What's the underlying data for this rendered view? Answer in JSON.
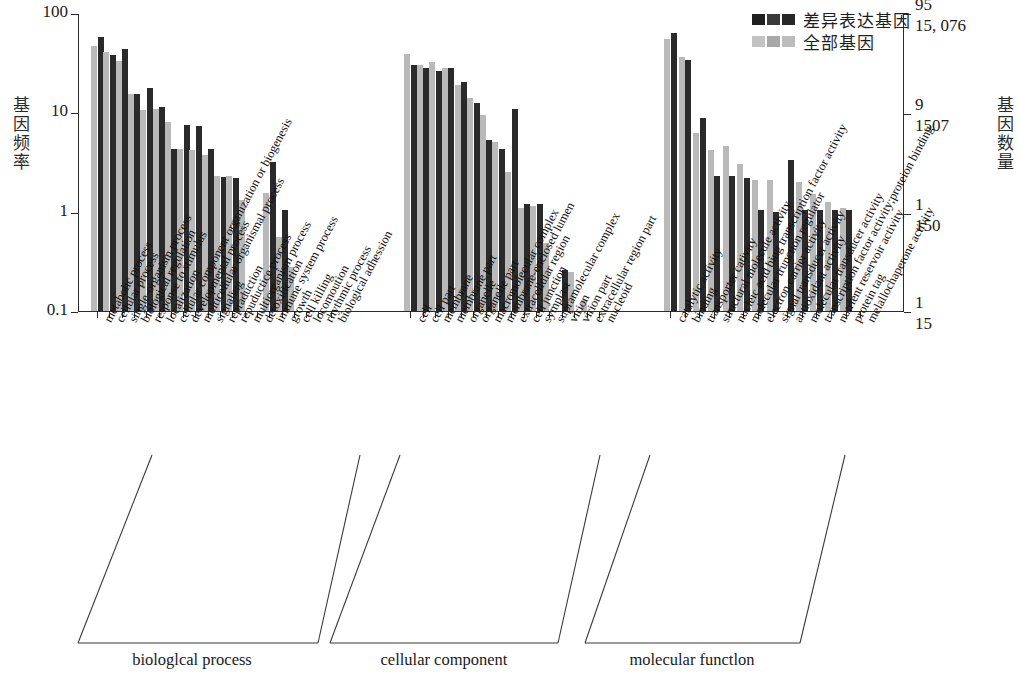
{
  "legend": {
    "items": [
      {
        "label": "差异表达基因",
        "color": "#2a2a2a",
        "key": "deg"
      },
      {
        "label": "全部基因",
        "color": "#b9b9b9",
        "key": "all"
      }
    ]
  },
  "axes": {
    "left": {
      "title": "基因频率",
      "ticks": [
        "100",
        "10",
        "1",
        "0.1"
      ],
      "range": [
        0.1,
        100
      ],
      "scale": "log"
    },
    "right": {
      "title": "基因数量",
      "tick_groups": [
        {
          "upper": "95",
          "lower": "15, 076"
        },
        {
          "upper": "9",
          "lower": "1507"
        },
        {
          "upper": "1",
          "lower": "150"
        },
        {
          "upper": "1",
          "lower": "15"
        }
      ]
    }
  },
  "groups": [
    {
      "name": "biologlcal process",
      "start": 0,
      "end": 17
    },
    {
      "name": "cellular component",
      "start": 17,
      "end": 33
    },
    {
      "name": "molecular functlon",
      "start": 33,
      "end": 48
    }
  ],
  "chart_data": {
    "type": "bar",
    "title": "",
    "xlabel": "",
    "ylabel": "基因频率",
    "ylabel_right": "基因数量",
    "ylim": [
      0.1,
      100
    ],
    "yscale": "log",
    "grid": false,
    "legend_position": "top-right",
    "categories": [
      "metabolic process",
      "cellular process",
      "single-organism process",
      "biological regulation",
      "response to stimulus",
      "localization",
      "cellular component organization or biogenesis",
      "developmental process",
      "multicellular organismal process",
      "signaling",
      "repraduction",
      "repuductice process",
      "multiorganism process",
      "detoxification",
      "immune system process",
      "growth",
      "cell killing",
      "locomoution",
      "rhythmic process",
      "biological adhession",
      "cell",
      "cell part",
      "membrane",
      "membrane part",
      "organelle",
      "organelle part",
      "macromolecular complex",
      "membrane-enclosed lumen",
      "extracellular region",
      "cell junction",
      "symplast",
      "supramolecular complex",
      "virion",
      "virion part",
      "extracellular region part",
      "nucleoid",
      "catalytic activity",
      "binding",
      "transporter cativity",
      "structural molecule activity",
      "nucleic acid bing transcription factor activity",
      "molecular trunction regulator",
      "electron carrier activity",
      "signal transducer activity",
      "antioxidant activity",
      "molecular transducer activity",
      "transcription factor activity;proteion binding",
      "nutrient reservoir activity",
      "protein tag",
      "melallochaperone activity"
    ],
    "series": [
      {
        "name": "全部基因",
        "color": "#b9b9b9",
        "values": [
          47,
          41,
          33,
          15.2,
          10.6,
          10.8,
          8.0,
          4.3,
          4.2,
          3.7,
          2.3,
          2.3,
          1.3,
          null,
          1.55,
          0.56,
          0.28,
          null,
          null,
          null,
          39,
          30,
          32,
          28,
          19,
          14,
          9.5,
          5.0,
          2.5,
          1.1,
          1.15,
          0.48,
          null,
          0.25,
          0.13,
          null,
          55,
          36,
          6.2,
          4.2,
          4.6,
          3.0,
          2.1,
          2.1,
          null,
          2.0,
          1.5,
          1.25,
          1.1,
          null
        ]
      },
      {
        "name": "差异表达基因",
        "color": "#2a2a2a",
        "values": [
          58,
          38,
          43,
          15.4,
          17.5,
          11.3,
          4.3,
          7.4,
          7.3,
          4.3,
          2.25,
          2.2,
          null,
          null,
          3.2,
          1.05,
          null,
          null,
          null,
          null,
          30,
          28,
          26,
          28,
          20,
          12.5,
          5.3,
          4.3,
          10.8,
          1.2,
          1.2,
          null,
          0.26,
          null,
          null,
          null,
          63,
          34,
          8.7,
          2.3,
          2.3,
          2.2,
          1.05,
          1.0,
          3.3,
          1.05,
          1.05,
          1.05,
          1.05,
          null
        ]
      }
    ]
  }
}
